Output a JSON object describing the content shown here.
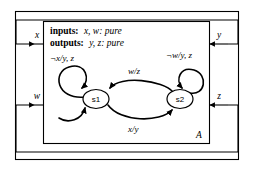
{
  "diagram": {
    "type": "state-machine-with-feedback",
    "actor_label": "A",
    "declarations": {
      "inputs_keyword": "inputs:",
      "inputs_value": "x, w: pure",
      "outputs_keyword": "outputs:",
      "outputs_value": "y, z: pure"
    },
    "ports": {
      "inputs": [
        {
          "name": "x",
          "label": "x",
          "side": "left",
          "position": "top"
        },
        {
          "name": "w",
          "label": "w",
          "side": "left",
          "position": "bottom"
        }
      ],
      "outputs": [
        {
          "name": "y",
          "label": "y",
          "side": "right",
          "position": "top"
        },
        {
          "name": "z",
          "label": "z",
          "side": "right",
          "position": "bottom"
        }
      ]
    },
    "feedback_wires": [
      {
        "name": "y-to-x",
        "from": "y",
        "to": "x",
        "route": "top"
      },
      {
        "name": "z-to-w",
        "from": "z",
        "to": "w",
        "route": "bottom"
      }
    ],
    "states": [
      {
        "id": "s1",
        "label": "s1",
        "initial": true
      },
      {
        "id": "s2",
        "label": "s2",
        "initial": false
      }
    ],
    "transitions": [
      {
        "name": "s1-self-loop",
        "from": "s1",
        "to": "s1",
        "label": "¬x/y, z"
      },
      {
        "name": "s2-self-loop",
        "from": "s2",
        "to": "s2",
        "label": "¬w/y, z"
      },
      {
        "name": "s2-to-s1",
        "from": "s2",
        "to": "s1",
        "label": "w/z"
      },
      {
        "name": "s1-to-s2",
        "from": "s1",
        "to": "s2",
        "label": "x/y"
      }
    ],
    "colors": {
      "stroke": "#000000",
      "fill": "#ffffff",
      "background": "#ffffff"
    }
  }
}
